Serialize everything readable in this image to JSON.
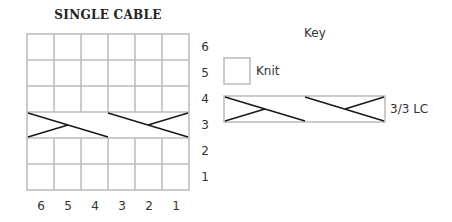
{
  "chart": {
    "title": "SINGLE CABLE",
    "columns": 6,
    "rows": 6,
    "row_labels": [
      "6",
      "5",
      "4",
      "3",
      "2",
      "1"
    ],
    "col_labels": [
      "6",
      "5",
      "4",
      "3",
      "2",
      "1"
    ],
    "cable_row": "3",
    "grid_color": "#bbbbbb",
    "line_color": "#1a1a1a"
  },
  "key": {
    "title": "Key",
    "items": [
      {
        "symbol": "empty-square",
        "label": "Knit"
      },
      {
        "symbol": "cable-cross",
        "label": "3/3 LC"
      }
    ]
  }
}
